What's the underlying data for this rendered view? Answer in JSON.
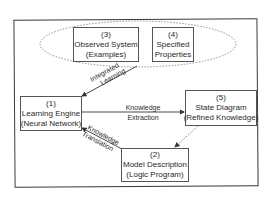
{
  "diagram": {
    "nodes": {
      "observed_system": {
        "num": "(3)",
        "line1": "Observed System",
        "line2": "(Examples)"
      },
      "specified_properties": {
        "num": "(4)",
        "line1": "Specified",
        "line2": "Properties"
      },
      "learning_engine": {
        "num": "(1)",
        "line1": "Learning Engine",
        "line2": "(Neural Network)"
      },
      "state_diagram": {
        "num": "(5)",
        "line1": "State Diagram",
        "line2": "(Refined Knowledge)"
      },
      "model_description": {
        "num": "(2)",
        "line1": "Model Description",
        "line2": "(Logic Program)"
      }
    },
    "edges": {
      "integrated_learning": {
        "line1": "Integrated",
        "line2": "Learning"
      },
      "knowledge_extraction": {
        "line1": "Knowledge",
        "line2": "Extraction"
      },
      "knowledge_translation": {
        "line1": "Knowledge",
        "line2": "Translation"
      }
    },
    "colors": {
      "stroke": "#333333",
      "dotted": "#777777",
      "text": "#2a2a2a"
    }
  }
}
